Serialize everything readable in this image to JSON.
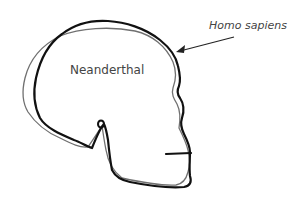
{
  "diagram": {
    "type": "skull-profile-comparison",
    "labels": {
      "neanderthal": "Neanderthal",
      "homo_sapiens": "Homo sapiens"
    },
    "outlines": [
      {
        "name": "Homo sapiens",
        "style": "thick",
        "color": "#111111"
      },
      {
        "name": "Neanderthal",
        "style": "thin",
        "color": "#6b6b6b"
      }
    ],
    "arrow": {
      "from_label": "Homo sapiens",
      "points_to": "Homo sapiens skull outline (forehead)"
    }
  }
}
